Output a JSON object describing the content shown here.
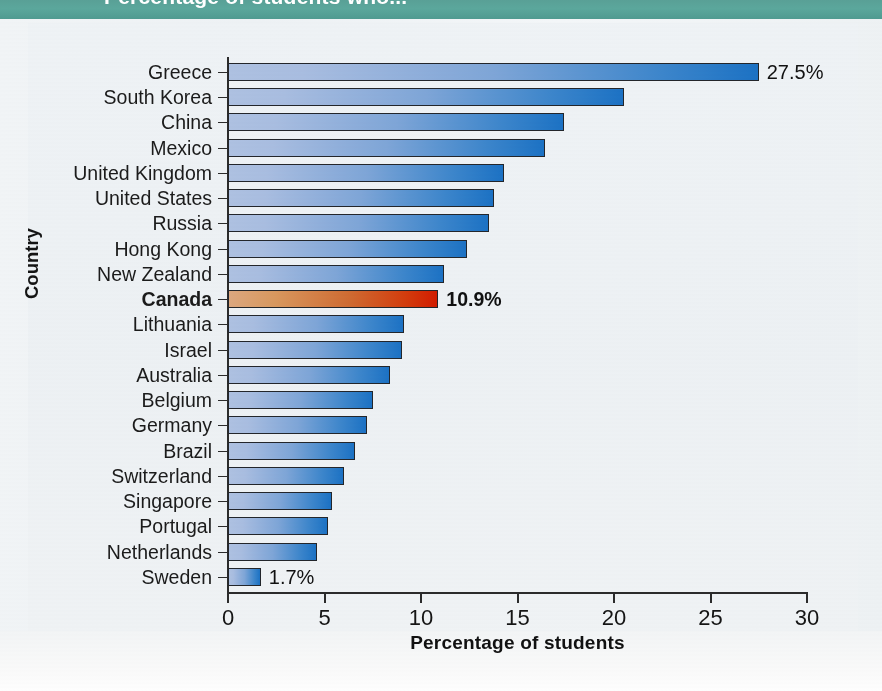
{
  "banner": {
    "text": "Percentage of students who..."
  },
  "chart_data": {
    "type": "bar",
    "orientation": "horizontal",
    "title": "",
    "xlabel": "Percentage of students",
    "ylabel": "Country",
    "xlim": [
      0,
      30
    ],
    "xticks": [
      "0",
      "5",
      "10",
      "15",
      "20",
      "25",
      "30"
    ],
    "grid": false,
    "legend": false,
    "highlight_category": "Canada",
    "colors": {
      "bar_start": "#afc2e2",
      "bar_end": "#1c72c5",
      "highlight_start": "#dda87f",
      "highlight_end": "#d31c00",
      "banner": "#59a096",
      "axis": "#2b2b2b",
      "text": "#141414"
    },
    "categories": [
      "Greece",
      "South Korea",
      "China",
      "Mexico",
      "United Kingdom",
      "United States",
      "Russia",
      "Hong Kong",
      "New Zealand",
      "Canada",
      "Lithuania",
      "Israel",
      "Australia",
      "Belgium",
      "Germany",
      "Brazil",
      "Switzerland",
      "Singapore",
      "Portugal",
      "Netherlands",
      "Sweden"
    ],
    "values": [
      27.5,
      20.5,
      17.4,
      16.4,
      14.3,
      13.8,
      13.5,
      12.4,
      11.2,
      10.9,
      9.1,
      9.0,
      8.4,
      7.5,
      7.2,
      6.6,
      6.0,
      5.4,
      5.2,
      4.6,
      1.7
    ],
    "labeled_points": [
      {
        "category": "Greece",
        "label": "27.5%",
        "bold": false
      },
      {
        "category": "Canada",
        "label": "10.9%",
        "bold": true
      },
      {
        "category": "Sweden",
        "label": "1.7%",
        "bold": false
      }
    ]
  }
}
